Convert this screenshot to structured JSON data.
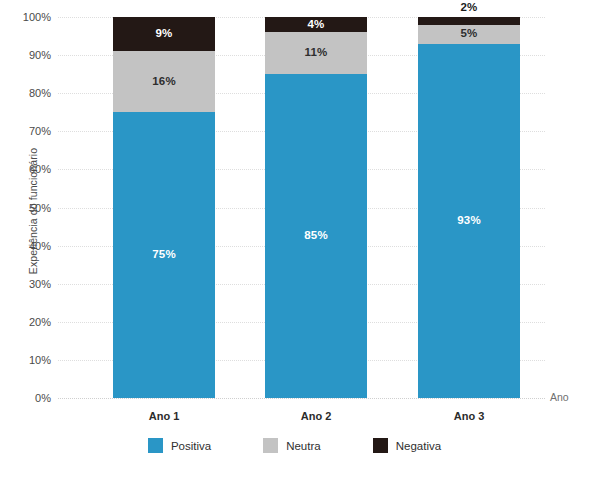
{
  "chart_data": {
    "type": "bar",
    "subtype": "100% stacked bar",
    "title": "",
    "xlabel": "Ano",
    "ylabel": "Experiência do funcionário",
    "categories": [
      "Ano 1",
      "Ano 2",
      "Ano 3"
    ],
    "series": [
      {
        "name": "Positiva",
        "color": "#2a96c6",
        "values": [
          75,
          85,
          93
        ],
        "value_labels": [
          "75%",
          "85%",
          "93%"
        ],
        "label_position": [
          "inside",
          "inside",
          "inside"
        ]
      },
      {
        "name": "Neutra",
        "color": "#c3c3c3",
        "values": [
          16,
          11,
          5
        ],
        "value_labels": [
          "16%",
          "11%",
          "5%"
        ],
        "label_position": [
          "inside",
          "inside",
          "inside"
        ]
      },
      {
        "name": "Negativa",
        "color": "#231815",
        "values": [
          9,
          4,
          2
        ],
        "value_labels": [
          "9%",
          "4%",
          "2%"
        ],
        "label_position": [
          "inside",
          "inside",
          "outside"
        ]
      }
    ],
    "ylim": [
      0,
      100
    ],
    "ytick_values": [
      0,
      10,
      20,
      30,
      40,
      50,
      60,
      70,
      80,
      90,
      100
    ],
    "ytick_labels": [
      "0%",
      "10%",
      "20%",
      "30%",
      "40%",
      "50%",
      "60%",
      "70%",
      "80%",
      "90%",
      "100%"
    ],
    "grid": {
      "horizontal": true,
      "vertical": false,
      "style": "dotted",
      "color": "#dedede"
    },
    "legend": {
      "position": "bottom",
      "entries": [
        {
          "label": "Positiva",
          "color": "#2a96c6"
        },
        {
          "label": "Neutra",
          "color": "#c3c3c3"
        },
        {
          "label": "Negativa",
          "color": "#231815"
        }
      ]
    },
    "background_color": "#ffffff"
  }
}
